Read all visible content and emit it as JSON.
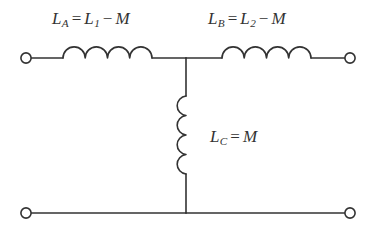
{
  "figure": {
    "background_color": "#ffffff",
    "line_color": "#333333",
    "text_color": "#333333",
    "stroke_width": 1.6
  },
  "labels": {
    "left_branch": {
      "symbol": "L",
      "subscript": "A",
      "equals": "=",
      "rhs_symbol": "L",
      "rhs_subscript": "1",
      "operator": "−",
      "operand": "M",
      "full_text": "L_A = L_1 − M"
    },
    "right_branch": {
      "symbol": "L",
      "subscript": "B",
      "equals": "=",
      "rhs_symbol": "L",
      "rhs_subscript": "2",
      "operator": "−",
      "operand": "M",
      "full_text": "L_B = L_2 − M"
    },
    "middle_branch": {
      "symbol": "L",
      "subscript": "C",
      "equals": "=",
      "operand": "M",
      "full_text": "L_C = M"
    }
  },
  "components": {
    "left_inductor": {
      "name": "inductor-la",
      "orientation": "horizontal",
      "coil_turns": 4
    },
    "right_inductor": {
      "name": "inductor-lb",
      "orientation": "horizontal",
      "coil_turns": 4
    },
    "middle_inductor": {
      "name": "inductor-lc",
      "orientation": "vertical",
      "coil_turns": 4
    }
  },
  "terminals": [
    {
      "name": "terminal-top-left",
      "position": "top-left"
    },
    {
      "name": "terminal-top-right",
      "position": "top-right"
    },
    {
      "name": "terminal-bottom-left",
      "position": "bottom-left"
    },
    {
      "name": "terminal-bottom-right",
      "position": "bottom-right"
    }
  ],
  "nodes": [
    {
      "name": "junction-top-center"
    },
    {
      "name": "junction-bottom-center"
    }
  ]
}
